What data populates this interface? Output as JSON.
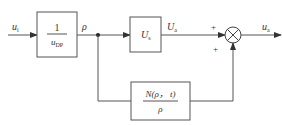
{
  "diagram": {
    "type": "block-diagram",
    "input": {
      "symbol": "u",
      "subscript": "i"
    },
    "output": {
      "symbol": "u",
      "subscript": "a"
    },
    "blocks": [
      {
        "id": "gain-block",
        "numerator": "1",
        "denominator": {
          "symbol": "u",
          "subscript": "DP"
        }
      },
      {
        "id": "us-block",
        "content": {
          "symbol": "U",
          "subscript": "s"
        }
      },
      {
        "id": "nonlinear-block",
        "numerator": "N(ρ， t)",
        "denominator": "ρ"
      }
    ],
    "signals": {
      "rho": "ρ",
      "ua": {
        "symbol": "U",
        "subscript": "a"
      }
    },
    "summing_junction": {
      "operator": "×",
      "signs": [
        "+",
        "+"
      ]
    },
    "colors": {
      "line": "#555555",
      "text": "#333333",
      "background": "#ffffff"
    }
  }
}
